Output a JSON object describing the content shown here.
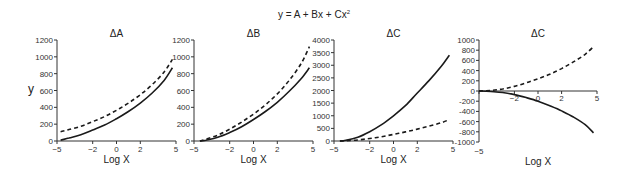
{
  "title": "y = A + Bx + Cx",
  "title_superscript": "2",
  "chart_data": [
    {
      "type": "line",
      "title": "ΔA",
      "xlabel": "Log X",
      "ylabel": "y",
      "xlim": [
        -5,
        5
      ],
      "ylim": [
        0,
        1200
      ],
      "xticks": [
        -5,
        -2,
        0,
        2,
        5
      ],
      "yticks": [
        0,
        200,
        400,
        600,
        800,
        1000,
        1200
      ],
      "grid": false,
      "series": [
        {
          "name": "solid",
          "style": "solid",
          "x": [
            -4.7,
            -4,
            -3,
            -2,
            -1,
            0,
            1,
            2,
            3,
            4,
            4.7
          ],
          "y": [
            10,
            35,
            75,
            130,
            190,
            265,
            350,
            450,
            570,
            720,
            870
          ]
        },
        {
          "name": "dashed",
          "style": "dashed",
          "x": [
            -4.7,
            -4,
            -3,
            -2,
            -1,
            0,
            1,
            2,
            3,
            4,
            4.7
          ],
          "y": [
            110,
            135,
            175,
            230,
            290,
            365,
            450,
            550,
            670,
            820,
            970
          ]
        }
      ]
    },
    {
      "type": "line",
      "title": "ΔB",
      "xlabel": "Log X",
      "ylabel": "",
      "xlim": [
        -5,
        5
      ],
      "ylim": [
        0,
        1200
      ],
      "xticks": [
        -5,
        -2,
        0,
        2,
        5
      ],
      "yticks": [
        0,
        200,
        400,
        600,
        800,
        1000,
        1200
      ],
      "grid": false,
      "series": [
        {
          "name": "solid",
          "style": "solid",
          "x": [
            -4.5,
            -4,
            -3,
            -2,
            -1,
            0,
            1,
            2,
            3,
            4,
            4.7
          ],
          "y": [
            0,
            10,
            45,
            100,
            170,
            255,
            350,
            460,
            590,
            740,
            870
          ]
        },
        {
          "name": "dashed",
          "style": "dashed",
          "x": [
            -4.5,
            -4,
            -3,
            -2,
            -1,
            0,
            1,
            2,
            3,
            4,
            4.7
          ],
          "y": [
            0,
            20,
            70,
            140,
            225,
            320,
            430,
            560,
            720,
            920,
            1120
          ]
        }
      ]
    },
    {
      "type": "line",
      "title": "ΔC",
      "xlabel": "Log X",
      "ylabel": "",
      "xlim": [
        -5,
        5
      ],
      "ylim": [
        0,
        4000
      ],
      "xticks": [
        -5,
        -2,
        0,
        2,
        5
      ],
      "yticks": [
        0,
        500,
        1000,
        1500,
        2000,
        2500,
        3000,
        3500,
        4000
      ],
      "grid": false,
      "series": [
        {
          "name": "solid",
          "style": "solid",
          "x": [
            -4.5,
            -4,
            -3,
            -2,
            -1,
            0,
            1,
            2,
            3,
            4,
            4.7
          ],
          "y": [
            0,
            30,
            150,
            370,
            650,
            1000,
            1400,
            1900,
            2400,
            2950,
            3400
          ]
        },
        {
          "name": "dashed",
          "style": "dashed",
          "x": [
            -4.5,
            -4,
            -3,
            -2,
            -1,
            0,
            1,
            2,
            3,
            4,
            4.7
          ],
          "y": [
            0,
            10,
            40,
            100,
            170,
            260,
            360,
            470,
            590,
            720,
            850
          ]
        }
      ]
    },
    {
      "type": "line",
      "title": "ΔC",
      "xlabel": "Log X",
      "ylabel": "",
      "xlim": [
        -5,
        5
      ],
      "ylim": [
        -1000,
        1000
      ],
      "xticks": [
        -5,
        -2,
        0,
        2,
        5
      ],
      "yticks": [
        -1000,
        -800,
        -600,
        -400,
        -200,
        0,
        200,
        400,
        600,
        800,
        1000
      ],
      "grid": false,
      "series": [
        {
          "name": "solid",
          "style": "solid",
          "x": [
            -5,
            -4,
            -3,
            -2,
            -1,
            0,
            1,
            2,
            3,
            4,
            4.7
          ],
          "y": [
            0,
            -10,
            -30,
            -70,
            -130,
            -200,
            -290,
            -390,
            -510,
            -660,
            -820
          ]
        },
        {
          "name": "dashed",
          "style": "dashed",
          "x": [
            -5,
            -4,
            -3,
            -2,
            -1,
            0,
            1,
            2,
            3,
            4,
            4.7
          ],
          "y": [
            0,
            10,
            40,
            90,
            160,
            240,
            330,
            440,
            570,
            720,
            870
          ]
        }
      ]
    }
  ],
  "layout": {
    "panels": [
      {
        "x0": 57,
        "x1": 176,
        "yTop": 40,
        "yBottom": 141,
        "xAxisY": 141,
        "xLabelY": 163,
        "ylabelX": 31,
        "ylabelY": 93,
        "xTickLabelY": 152
      },
      {
        "x0": 194,
        "x1": 313,
        "yTop": 40,
        "yBottom": 141,
        "xAxisY": 141,
        "xLabelY": 163,
        "xTickLabelY": 152
      },
      {
        "x0": 334,
        "x1": 453,
        "yTop": 40,
        "yBottom": 141,
        "xAxisY": 141,
        "xLabelY": 163,
        "xTickLabelY": 152
      },
      {
        "x0": 479,
        "x1": 597,
        "yTop": 40,
        "yBottom": 142,
        "xAxisY": 91,
        "xLabelY": 165,
        "xTickLabelY": 101,
        "yAxisMinLabel": true
      }
    ]
  },
  "colors": {
    "line": "#1a1a1a",
    "axis": "#333333"
  }
}
